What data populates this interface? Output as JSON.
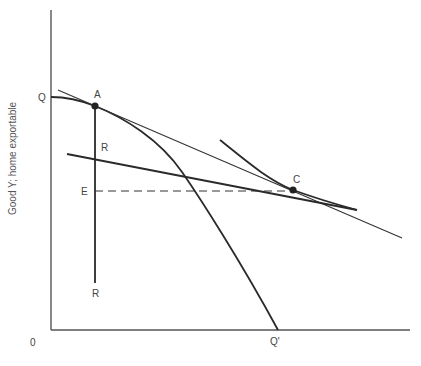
{
  "diagram": {
    "type": "economics-ppf-trade",
    "y_axis_label": "Good Y;  home exportable",
    "origin_label": "0",
    "labels": {
      "Q": "Q",
      "Q_prime": "Q'",
      "A": "A",
      "C": "C",
      "E": "E",
      "R_top": "R",
      "R_bottom": "R"
    },
    "points": {
      "A": [
        95,
        106
      ],
      "C": [
        293,
        190
      ]
    },
    "colors": {
      "ink": "#2a2a2a",
      "axis": "#444444",
      "text": "#444444"
    }
  }
}
